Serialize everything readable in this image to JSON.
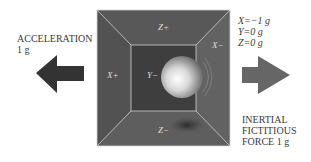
{
  "left_caption": {
    "line1": "ACCELERATION",
    "line2": "1 g"
  },
  "readout": {
    "x": "X=−1 g",
    "y": "Y=0 g",
    "z": "Z=0 g"
  },
  "right_caption": {
    "line1": "INERTIAL",
    "line2": "FICTITIOUS",
    "line3": "FORCE 1 g"
  },
  "faces": {
    "top": "Z+",
    "bottom": "Z−",
    "left": "X+",
    "right": "X−",
    "back": "Y−"
  },
  "colors": {
    "box_outer": "#5a5a5a",
    "box_inner": "#3e3e3e",
    "edge": "#cfcfcf",
    "arrow_left": "#333333",
    "arrow_right": "#666666"
  }
}
